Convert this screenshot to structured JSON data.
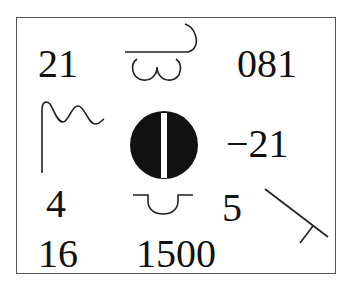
{
  "figure": {
    "numbers": [
      {
        "id": "top-left",
        "text": "21"
      },
      {
        "id": "top-right",
        "text": "081"
      },
      {
        "id": "middle-right",
        "text": "−21"
      },
      {
        "id": "lower-left",
        "text": "4"
      },
      {
        "id": "lower-right",
        "text": "5"
      },
      {
        "id": "bottom-left",
        "text": "16"
      },
      {
        "id": "bottom-center",
        "text": "1500"
      }
    ],
    "symbols": [
      {
        "id": "top-center",
        "name": "line-with-loops-symbol"
      },
      {
        "id": "middle-left",
        "name": "wave-flag-symbol"
      },
      {
        "id": "center",
        "name": "slotted-circle-symbol"
      },
      {
        "id": "lower-center",
        "name": "cup-on-line-symbol"
      },
      {
        "id": "lower-right-corner",
        "name": "diagonal-t-symbol"
      }
    ],
    "colors": {
      "ink": "#111111",
      "frame": "#555555",
      "background": "#ffffff"
    }
  }
}
